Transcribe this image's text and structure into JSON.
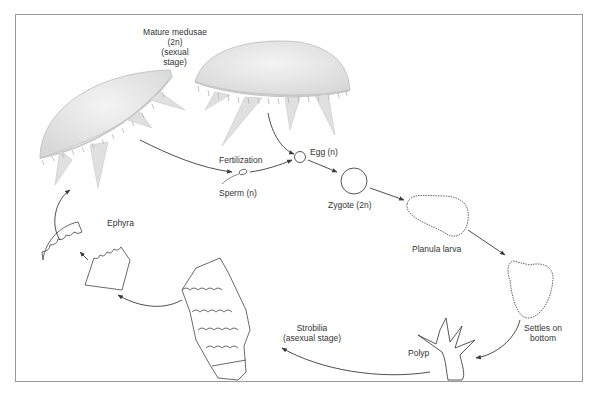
{
  "diagram": {
    "stages": {
      "mature_medusae": {
        "line1": "Mature medusae",
        "line2": "(2n)",
        "line3": "(sexual",
        "line4": "stage)"
      },
      "fertilization": "Fertilization",
      "sperm": "Sperm (n)",
      "egg": "Egg (n)",
      "zygote": "Zygote (2n)",
      "planula": "Planula larva",
      "settles": {
        "line1": "Settles on",
        "line2": "bottom"
      },
      "polyp": "Polyp",
      "strobilia": {
        "line1": "Strobilia",
        "line2": "(asexual stage)"
      },
      "ephyra": "Ephyra"
    },
    "colors": {
      "frame": "#9a9a9a",
      "ink": "#333333",
      "medusa_fill": "#e4e4e4",
      "arrow": "#3a3a3a"
    }
  }
}
